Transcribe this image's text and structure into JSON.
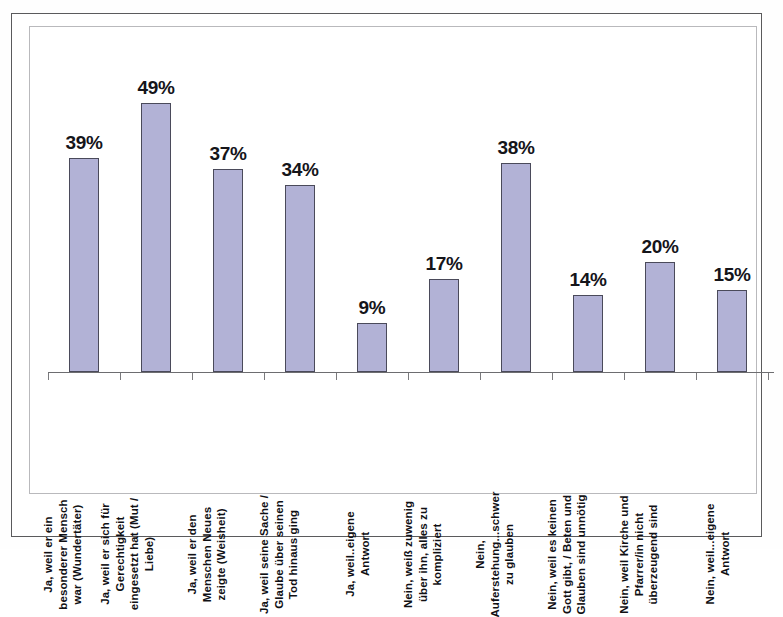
{
  "chart_data": {
    "type": "bar",
    "title": "",
    "subtitle": "",
    "xlabel": "",
    "ylabel": "",
    "ylim": [
      0,
      55
    ],
    "grid": false,
    "legend": false,
    "value_suffix": "%",
    "bar_color": "#b2b2d6",
    "bar_border_color": "#4a4a5a",
    "frame_color": "#5a5a5c",
    "categories": [
      "Ja, weil er ein besonderer Mensch war (Wundertäter)",
      "Ja, weil er sich für Gerechtigkeit eingesetzt hat (Mut / Liebe)",
      "Ja, weil er den Menschen Neues zeigte (Weisheit)",
      "Ja, weil seine Sache / Glaube über seinen Tod hinaus ging",
      "Ja, weil..eigene Antwort",
      "Nein, weiß zuwenig über ihn, alles zu kompliziert",
      "Nein, Auferstehung...schwer zu glauben",
      "Nein, weil es keinen Gott gibt, / Beten und Glauben sind unnötig",
      "Nein, weil Kirche und Pfarrer/in nicht überzeugend sind",
      "Nein, weil...eigene Antwort"
    ],
    "category_lines": [
      [
        "Ja, weil er ein",
        "besonderer Mensch",
        "war (Wundertäter)"
      ],
      [
        "Ja, weil er sich für",
        "Gerechtigkeit",
        "eingesetzt hat (Mut /",
        "Liebe)"
      ],
      [
        "Ja, weil er den",
        "Menschen Neues",
        "zeigte (Weisheit)"
      ],
      [
        "Ja, weil seine Sache /",
        "Glaube über seinen",
        "Tod hinaus ging"
      ],
      [
        "Ja, weil..eigene",
        "Antwort"
      ],
      [
        "Nein, weiß zuwenig",
        "über ihn, alles zu",
        "kompliziert"
      ],
      [
        "Nein,",
        "Auferstehung...schwer",
        "zu glauben"
      ],
      [
        "Nein, weil es keinen",
        "Gott gibt, / Beten und",
        "Glauben sind unnötig"
      ],
      [
        "Nein, weil Kirche und",
        "Pfarrer/in nicht",
        "überzeugend sind"
      ],
      [
        "Nein, weil...eigene",
        "Antwort"
      ]
    ],
    "values": [
      39,
      49,
      37,
      34,
      9,
      17,
      38,
      14,
      20,
      15
    ],
    "value_labels": [
      "39%",
      "49%",
      "37%",
      "34%",
      "9%",
      "17%",
      "38%",
      "14%",
      "20%",
      "15%"
    ]
  }
}
